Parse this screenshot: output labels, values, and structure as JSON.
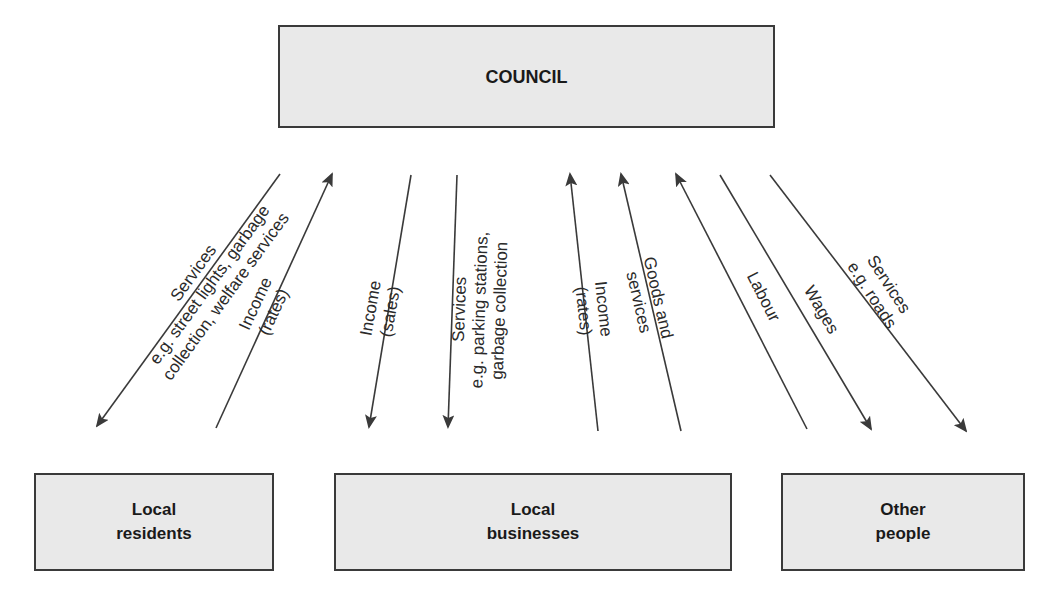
{
  "diagram": {
    "nodes": {
      "council": {
        "label": "COUNCIL"
      },
      "residents": {
        "line1": "Local",
        "line2": "residents"
      },
      "businesses": {
        "line1": "Local",
        "line2": "businesses"
      },
      "other": {
        "line1": "Other",
        "line2": "people"
      }
    },
    "flows": [
      {
        "from": "Council",
        "to": "Local residents",
        "line1": "Services",
        "line2": "e.g. street lights, garbage",
        "line3": "collection, welfare services"
      },
      {
        "from": "Local residents",
        "to": "Council",
        "line1": "Income",
        "line2": "(rates)"
      },
      {
        "from": "Council",
        "to": "Local businesses",
        "line1": "Income",
        "line2": "(sales)"
      },
      {
        "from": "Council",
        "to": "Local businesses",
        "line1": "Services",
        "line2": "e.g. parking stations,",
        "line3": "garbage collection"
      },
      {
        "from": "Local businesses",
        "to": "Council",
        "line1": "Income",
        "line2": "(rates)"
      },
      {
        "from": "Local businesses",
        "to": "Council",
        "line1": "Goods and",
        "line2": "services"
      },
      {
        "from": "Other people",
        "to": "Council",
        "line1": "Labour"
      },
      {
        "from": "Council",
        "to": "Other people",
        "line1": "Wages"
      },
      {
        "from": "Council",
        "to": "Other people",
        "line1": "Services",
        "line2": "e.g. roads"
      }
    ],
    "colors": {
      "box_fill": "#e9e9e9",
      "box_border": "#3a3a3a",
      "arrow": "#3a3a3a"
    }
  }
}
